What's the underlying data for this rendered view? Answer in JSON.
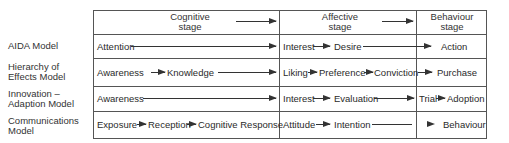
{
  "diagram": {
    "columns": [
      {
        "label_line1": "Cognitive",
        "label_line2": "stage"
      },
      {
        "label_line1": "Affective",
        "label_line2": "stage"
      },
      {
        "label_line1": "Behaviour",
        "label_line2": "stage"
      }
    ],
    "rows": [
      {
        "model_line1": "AIDA Model",
        "model_line2": "",
        "cognitive": [
          "Attention"
        ],
        "affective": [
          "Interest",
          "Desire"
        ],
        "behaviour": [
          "Action"
        ]
      },
      {
        "model_line1": "Hierarchy of",
        "model_line2": "Effects Model",
        "cognitive": [
          "Awareness",
          "Knowledge"
        ],
        "affective": [
          "Liking",
          "Preference",
          "Conviction"
        ],
        "behaviour": [
          "Purchase"
        ]
      },
      {
        "model_line1": "Innovation –",
        "model_line2": "Adaption Model",
        "cognitive": [
          "Awareness"
        ],
        "affective": [
          "Interest",
          "Evaluation"
        ],
        "behaviour": [
          "Trial",
          "Adoption"
        ]
      },
      {
        "model_line1": "Communications",
        "model_line2": "Model",
        "cognitive": [
          "Exposure",
          "Reception",
          "Cognitive Response"
        ],
        "affective": [
          "Attitude",
          "Intention"
        ],
        "behaviour": [
          "Behaviour"
        ]
      }
    ],
    "colors": {
      "line": "#555555",
      "text": "#2a2a2a"
    }
  }
}
